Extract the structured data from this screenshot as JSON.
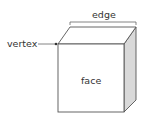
{
  "diagram": {
    "type": "cube-parts",
    "labels": {
      "edge": "edge",
      "vertex": "vertex",
      "face": "face"
    },
    "colors": {
      "stroke": "#555555",
      "front_face": "#ffffff",
      "top_face": "#ffffff",
      "side_face": "#d9d9d9",
      "text": "#333333"
    }
  }
}
